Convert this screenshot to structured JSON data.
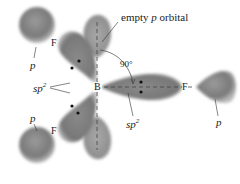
{
  "diagram": {
    "labels": {
      "empty_p_prefix": "empty ",
      "empty_p_italic": "p",
      "empty_p_suffix": " orbital",
      "angle": "90°",
      "boron": "B",
      "fluorine_top": "F",
      "fluorine_right": "F",
      "fluorine_bottom": "F",
      "p_top_left": "p",
      "p_bottom_left": "p",
      "p_right": "p",
      "sp2_left_base": "sp",
      "sp2_left_sup": "2",
      "sp2_right_base": "sp",
      "sp2_right_sup": "2"
    },
    "colors": {
      "orbital_dark": "#6f6f6f",
      "orbital_light": "#b5b5b5",
      "text": "#222222",
      "dashes": "#444444"
    }
  }
}
